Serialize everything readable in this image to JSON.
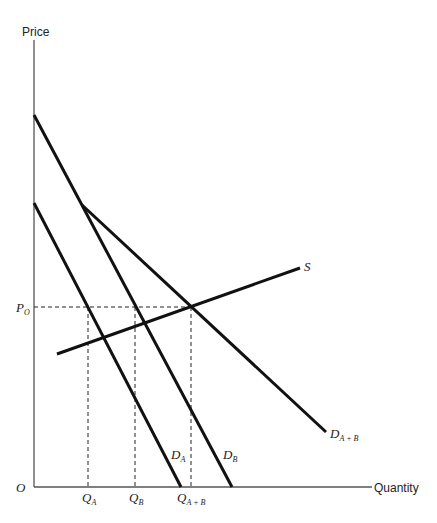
{
  "diagram": {
    "type": "supply-demand",
    "axes": {
      "y_label": "Price",
      "x_label": "Quantity",
      "origin_label": "O"
    },
    "price_label": {
      "main": "P",
      "sub": "O"
    },
    "quantity_labels": [
      {
        "main": "Q",
        "sub": "A"
      },
      {
        "main": "Q",
        "sub": "B"
      },
      {
        "main": "Q",
        "sub": "A + B"
      }
    ],
    "curves": [
      {
        "name": "D_A",
        "main": "D",
        "sub": "A"
      },
      {
        "name": "D_B",
        "main": "D",
        "sub": "B"
      },
      {
        "name": "D_A+B",
        "main": "D",
        "sub": "A + B"
      },
      {
        "name": "S",
        "main": "S",
        "sub": ""
      }
    ],
    "colors": {
      "line": "#111111",
      "axis": "#555555",
      "background": "#ffffff"
    }
  }
}
